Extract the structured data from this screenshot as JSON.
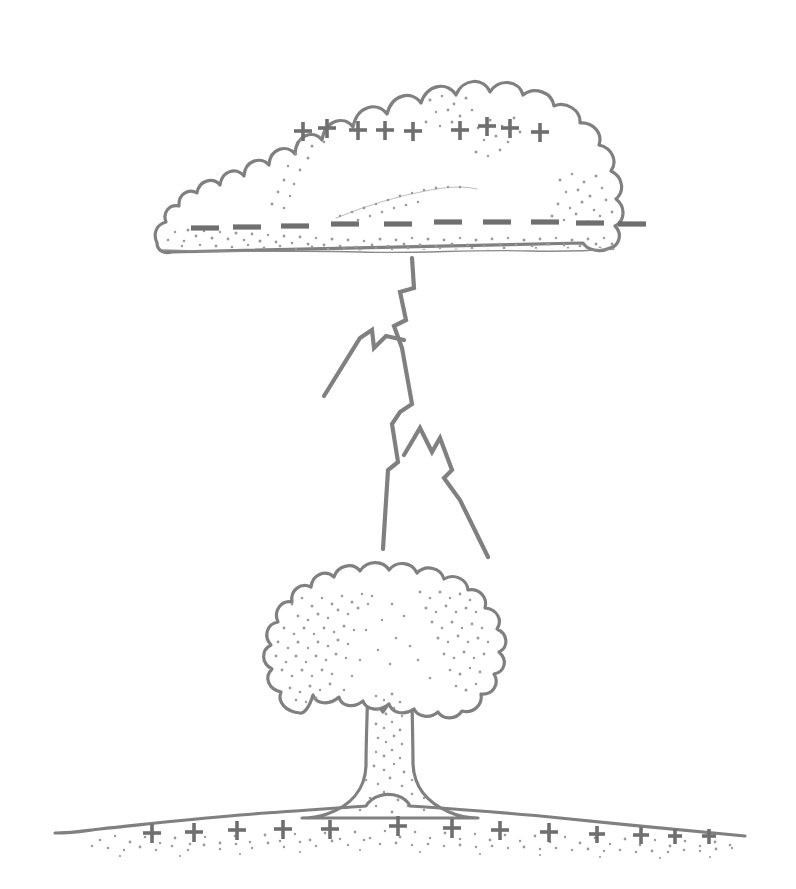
{
  "figure": {
    "background_color": "#ffffff",
    "ink_color": "#808080",
    "charge_color": "#6f6f6f",
    "stipple_color": "#9a9a9a",
    "width": 796,
    "height": 889
  },
  "cloud": {
    "name": "thundercloud",
    "bounds": {
      "x": 150,
      "y": 62,
      "width": 510,
      "height": 200
    },
    "positive_charges": {
      "symbol": "+",
      "count": 9,
      "region": "upper cloud",
      "positions": [
        {
          "x": 303,
          "y": 131
        },
        {
          "x": 327,
          "y": 128
        },
        {
          "x": 358,
          "y": 130
        },
        {
          "x": 385,
          "y": 130
        },
        {
          "x": 413,
          "y": 131
        },
        {
          "x": 460,
          "y": 130
        },
        {
          "x": 487,
          "y": 126
        },
        {
          "x": 510,
          "y": 128
        },
        {
          "x": 540,
          "y": 132
        }
      ]
    },
    "negative_charges": {
      "symbol": "–",
      "count": 10,
      "region": "cloud base",
      "positions": [
        {
          "x": 205,
          "y": 228
        },
        {
          "x": 247,
          "y": 227
        },
        {
          "x": 295,
          "y": 226
        },
        {
          "x": 345,
          "y": 224
        },
        {
          "x": 398,
          "y": 224
        },
        {
          "x": 448,
          "y": 222
        },
        {
          "x": 497,
          "y": 222
        },
        {
          "x": 545,
          "y": 222
        },
        {
          "x": 590,
          "y": 223
        },
        {
          "x": 632,
          "y": 224
        }
      ]
    }
  },
  "lightning": {
    "name": "lightning-bolt",
    "origin": {
      "x": 412,
      "y": 258
    },
    "main_channel_end": {
      "x": 383,
      "y": 549
    },
    "branches": [
      {
        "name": "upper-left-branch",
        "end": {
          "x": 324,
          "y": 396
        }
      },
      {
        "name": "lower-right-branch",
        "end": {
          "x": 488,
          "y": 557
        }
      }
    ],
    "segments": 9
  },
  "tree": {
    "name": "tree",
    "canopy": {
      "cx": 390,
      "cy": 648,
      "rx": 112,
      "ry": 78
    },
    "trunk": {
      "x": 390,
      "top": 690,
      "base": 815
    },
    "canopy_bumps": 22
  },
  "ground": {
    "name": "ground-line",
    "left": {
      "x": 55,
      "y": 833
    },
    "right": {
      "x": 745,
      "y": 836
    },
    "positive_charges": {
      "symbol": "+",
      "count": 13,
      "positions": [
        {
          "x": 152,
          "y": 833
        },
        {
          "x": 194,
          "y": 832
        },
        {
          "x": 237,
          "y": 830
        },
        {
          "x": 283,
          "y": 829
        },
        {
          "x": 330,
          "y": 829
        },
        {
          "x": 398,
          "y": 826
        },
        {
          "x": 452,
          "y": 828
        },
        {
          "x": 500,
          "y": 830
        },
        {
          "x": 549,
          "y": 832
        },
        {
          "x": 597,
          "y": 834
        },
        {
          "x": 641,
          "y": 835
        },
        {
          "x": 675,
          "y": 836
        },
        {
          "x": 709,
          "y": 836
        }
      ]
    }
  },
  "labels": {
    "caption": "",
    "annotations": []
  }
}
